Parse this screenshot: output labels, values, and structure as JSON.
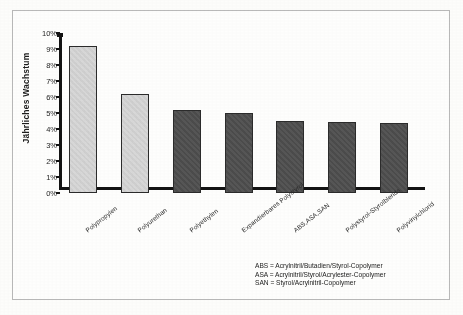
{
  "chart_data": {
    "type": "bar",
    "title": "",
    "xlabel": "",
    "ylabel": "Jährliches Wachstum",
    "ylim": [
      0,
      10
    ],
    "ytick_labels": [
      "10%",
      "9%",
      "8%",
      "7%",
      "6%",
      "5%",
      "4%",
      "3%",
      "2%",
      "1%",
      "0%"
    ],
    "ytick_values": [
      10,
      9,
      8,
      7,
      6,
      5,
      4,
      3,
      2,
      1,
      0
    ],
    "grid": false,
    "legend_position": "bottom-right",
    "categories": [
      "Polypropylen",
      "Polyurethan",
      "Polyethylen",
      "Expandierbares Polystyrol",
      "ABS,ASA,SAN",
      "Polystyrol-Styrolblends",
      "Polyvinylchlorid"
    ],
    "values": [
      9.2,
      6.2,
      5.2,
      5.0,
      4.5,
      4.45,
      4.4
    ],
    "value_labels": [
      "9,2%",
      "6,2%",
      "5,2%",
      "5,0%",
      "4,5%",
      "4,45%",
      "4,4%"
    ],
    "bar_colors": [
      "#d6d6d6",
      "#d6d6d6",
      "#4d4d4d",
      "#4d4d4d",
      "#4d4d4d",
      "#4d4d4d",
      "#4d4d4d"
    ],
    "bar_edge_color": "#2b2b2b",
    "axis_color": "#131313"
  },
  "legend": {
    "lines": [
      "ABS = Acrylnitril/Butadien/Styrol-Copolymer",
      "ASA = Acrylnitril/Styrol/Acrylester-Copolymer",
      "SAN = Styrol/Acrylnitril-Copolymer"
    ]
  }
}
